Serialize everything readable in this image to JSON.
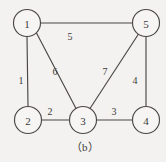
{
  "figure": {
    "caption": "（b）",
    "background_color": "#f3f2f0",
    "ink_color": "#4a4746"
  },
  "chart_data": {
    "type": "diagram",
    "diagram_kind": "undirected-weighted-graph",
    "title": "（b）",
    "nodes": [
      {
        "id": "n1",
        "label": "1",
        "x": 27,
        "y": 23,
        "r": 13.5
      },
      {
        "id": "n5",
        "label": "5",
        "x": 146,
        "y": 23,
        "r": 13.5
      },
      {
        "id": "n2",
        "label": "2",
        "x": 28,
        "y": 120,
        "r": 13.5
      },
      {
        "id": "n3",
        "label": "3",
        "x": 83,
        "y": 120,
        "r": 13.5
      },
      {
        "id": "n4",
        "label": "4",
        "x": 146,
        "y": 120,
        "r": 13.5
      }
    ],
    "edges": [
      {
        "id": "e15",
        "from": "n1",
        "to": "n5",
        "weight": "5",
        "x1": 40.5,
        "y1": 23,
        "x2": 132.5,
        "y2": 23,
        "lx": 70,
        "ly": 36
      },
      {
        "id": "e12",
        "from": "n1",
        "to": "n2",
        "weight": "1",
        "x1": 27,
        "y1": 36.5,
        "x2": 28,
        "y2": 106.5,
        "lx": 21,
        "ly": 80
      },
      {
        "id": "e13",
        "from": "n1",
        "to": "n3",
        "weight": "6",
        "x1": 36.5,
        "y1": 33,
        "x2": 76,
        "y2": 108.5,
        "lx": 55,
        "ly": 71
      },
      {
        "id": "e35",
        "from": "n3",
        "to": "n5",
        "weight": "7",
        "x1": 90,
        "y1": 108.5,
        "x2": 138.5,
        "y2": 34,
        "lx": 105,
        "ly": 71
      },
      {
        "id": "e54",
        "from": "n5",
        "to": "n4",
        "weight": "4",
        "x1": 146,
        "y1": 36.5,
        "x2": 146,
        "y2": 106.5,
        "lx": 135,
        "ly": 80
      },
      {
        "id": "e23",
        "from": "n2",
        "to": "n3",
        "weight": "2",
        "x1": 41.5,
        "y1": 120,
        "x2": 69.5,
        "y2": 120,
        "lx": 50,
        "ly": 111
      },
      {
        "id": "e34",
        "from": "n3",
        "to": "n4",
        "weight": "3",
        "x1": 96.5,
        "y1": 120,
        "x2": 132.5,
        "y2": 120,
        "lx": 114,
        "ly": 111
      }
    ],
    "node_labels": [
      "1",
      "5",
      "2",
      "3",
      "4"
    ],
    "edge_weights": [
      "5",
      "1",
      "6",
      "7",
      "4",
      "2",
      "3"
    ]
  }
}
